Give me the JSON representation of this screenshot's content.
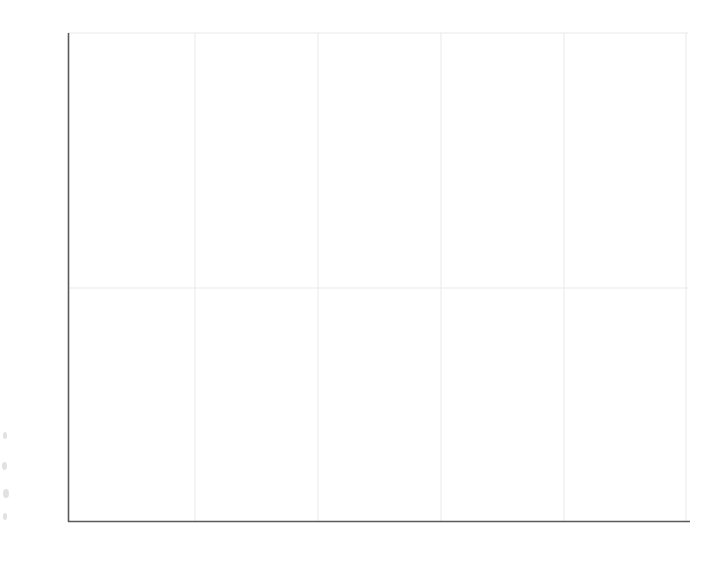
{
  "chart_data": {
    "type": "line",
    "title": "",
    "subtitle": "",
    "xlabel": "",
    "ylabel": "",
    "xlim": [
      0,
      5.0
    ],
    "ylim": [
      0,
      2.0
    ],
    "grid": true,
    "legend": null,
    "decimal_separator": ",",
    "x_tick_labels": [
      "0",
      "1,0",
      "2,0",
      "3,0",
      "4,0",
      "5,0"
    ],
    "x_tick_values": [
      0,
      1.0,
      2.0,
      3.0,
      4.0,
      5.0
    ],
    "y_tick_labels": [
      "0",
      "1,0",
      "2,0"
    ],
    "y_tick_values": [
      0,
      1.0,
      2.0
    ],
    "series": [
      {
        "name": "density-curve",
        "color": "#3c3c3c",
        "line_width": 4,
        "x": [
          0.0,
          0.05,
          0.1,
          0.15,
          0.2,
          0.24,
          0.3,
          0.35,
          0.4,
          0.5,
          0.6,
          0.7,
          0.8,
          0.9,
          1.0,
          1.2,
          1.4,
          1.6,
          1.8,
          2.0,
          2.25,
          2.5,
          2.75,
          3.0,
          3.25,
          3.5,
          3.75,
          3.9,
          4.0,
          4.25,
          4.5,
          4.75,
          5.0
        ],
        "y": [
          2.0,
          1.7,
          1.46,
          1.27,
          1.11,
          1.0,
          0.88,
          0.8,
          0.72,
          0.6,
          0.52,
          0.455,
          0.405,
          0.365,
          0.33,
          0.272,
          0.23,
          0.198,
          0.172,
          0.152,
          0.131,
          0.114,
          0.101,
          0.09,
          0.081,
          0.073,
          0.066,
          0.063,
          0.061,
          0.056,
          0.052,
          0.048,
          0.045
        ]
      }
    ],
    "shaded_region": {
      "name": "tail-area",
      "x_start": 3.9,
      "x_end": 5.0,
      "color": "#9b9b9b",
      "label": ""
    },
    "axis": {
      "color": "#5a5a5a",
      "grid_color": "#e9e9e9"
    }
  }
}
